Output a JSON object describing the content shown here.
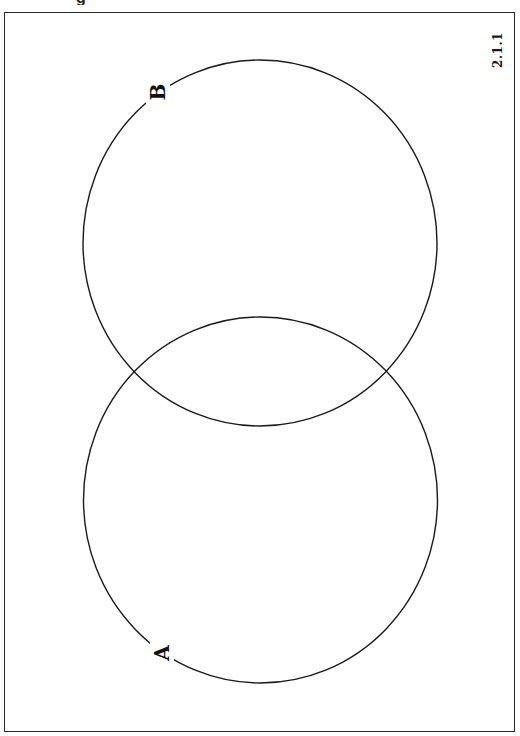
{
  "header": {
    "cropped_fragment": "g"
  },
  "figure": {
    "id": "2.1.1",
    "type": "venn-diagram",
    "orientation": "rotated -90deg (labels read bottom-to-top)",
    "border_color": "#2a2a2a",
    "stroke_color": "#1a1a1a",
    "background": "#ffffff"
  },
  "sets": [
    {
      "label": "A",
      "position": "lower",
      "center": [
        260.5,
        500
      ],
      "rx": 177,
      "ry": 183
    },
    {
      "label": "B",
      "position": "upper",
      "center": [
        260,
        243
      ],
      "rx": 177,
      "ry": 183
    }
  ],
  "labels": {
    "set_a": "A",
    "set_b": "B",
    "figure_number": "2.1.1"
  }
}
